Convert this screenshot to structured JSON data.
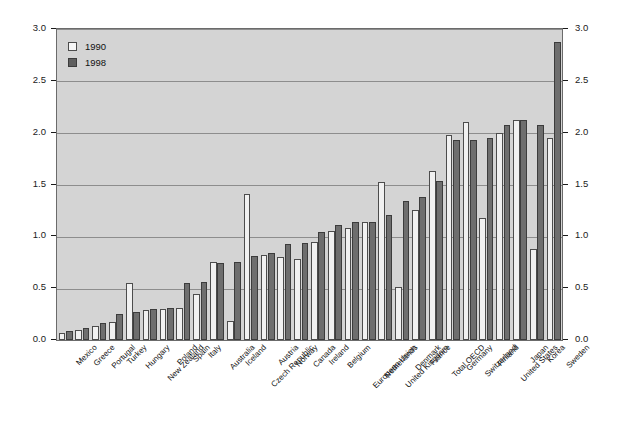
{
  "chart_data": {
    "type": "bar",
    "title": "",
    "subtitle": "",
    "xlabel": "",
    "ylabel": "",
    "ylim": [
      0.0,
      3.0
    ],
    "ytick_labels": [
      "0.0",
      "0.5",
      "1.0",
      "1.5",
      "2.0",
      "2.5",
      "3.0"
    ],
    "ytick_values": [
      0.0,
      0.5,
      1.0,
      1.5,
      2.0,
      2.5,
      3.0
    ],
    "grid": true,
    "grid_axis": "y",
    "legend_position": "top-left",
    "dual_y_axis": true,
    "categories": [
      "Mexico",
      "Greece",
      "Portugal",
      "Turkey",
      "Hungary",
      "New Zealand",
      "Poland",
      "Spain",
      "Italy",
      "Australia",
      "Iceland",
      "Czech Republic",
      "Austria",
      "Norway",
      "Canada",
      "Ireland",
      "Belgium",
      "European Union",
      "Netherlands",
      "United Kingdom",
      "Denmark",
      "France",
      "Total OECD",
      "Germany",
      "Switzerland",
      "Finland",
      "United States",
      "Japan",
      "Korea",
      "Sweden"
    ],
    "series": [
      {
        "name": "1990",
        "color": "#f1f1f1",
        "values": [
          0.07,
          0.1,
          0.14,
          0.17,
          0.55,
          0.29,
          0.3,
          0.31,
          0.44,
          0.75,
          0.18,
          1.41,
          0.82,
          0.8,
          0.78,
          0.95,
          1.05,
          1.08,
          1.14,
          1.52,
          0.51,
          1.25,
          1.63,
          1.98,
          2.1,
          1.18,
          2.0,
          2.12,
          0.88,
          1.95
        ]
      },
      {
        "name": "1998",
        "color": "#6e6e6e",
        "values": [
          0.09,
          0.12,
          0.16,
          0.25,
          0.27,
          0.3,
          0.31,
          0.55,
          0.56,
          0.74,
          0.75,
          0.81,
          0.84,
          0.93,
          0.94,
          1.04,
          1.11,
          1.14,
          1.14,
          1.21,
          1.34,
          1.38,
          1.53,
          1.93,
          1.93,
          1.95,
          2.07,
          2.12,
          2.07,
          2.87
        ]
      }
    ]
  },
  "legend": {
    "entries": [
      {
        "label": "1990",
        "key": "y1990"
      },
      {
        "label": "1998",
        "key": "y1998"
      }
    ]
  }
}
